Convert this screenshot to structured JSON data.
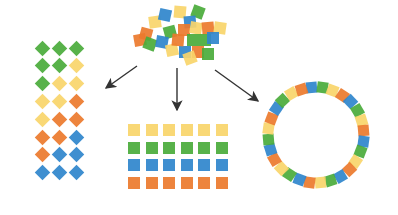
{
  "colors": {
    "green": "#4aab3b",
    "yellow": "#f8d56a",
    "orange": "#ec7a2c",
    "blue": "#2f86cc",
    "arrow": "#333333"
  },
  "pile": [
    {
      "x": 146,
      "y": 34,
      "s": 12,
      "r": 15,
      "c": "orange"
    },
    {
      "x": 140,
      "y": 40,
      "s": 12,
      "r": -10,
      "c": "orange"
    },
    {
      "x": 150,
      "y": 44,
      "s": 12,
      "r": 20,
      "c": "green"
    },
    {
      "x": 155,
      "y": 22,
      "s": 12,
      "r": -8,
      "c": "yellow"
    },
    {
      "x": 165,
      "y": 15,
      "s": 12,
      "r": 12,
      "c": "blue"
    },
    {
      "x": 170,
      "y": 32,
      "s": 12,
      "r": -15,
      "c": "green"
    },
    {
      "x": 162,
      "y": 42,
      "s": 12,
      "r": 10,
      "c": "blue"
    },
    {
      "x": 172,
      "y": 50,
      "s": 12,
      "r": -12,
      "c": "yellow"
    },
    {
      "x": 180,
      "y": 12,
      "s": 12,
      "r": 5,
      "c": "yellow"
    },
    {
      "x": 198,
      "y": 12,
      "s": 12,
      "r": 20,
      "c": "green"
    },
    {
      "x": 190,
      "y": 22,
      "s": 12,
      "r": -5,
      "c": "blue"
    },
    {
      "x": 184,
      "y": 30,
      "s": 12,
      "r": 0,
      "c": "orange"
    },
    {
      "x": 196,
      "y": 28,
      "s": 12,
      "r": 10,
      "c": "yellow"
    },
    {
      "x": 208,
      "y": 28,
      "s": 12,
      "r": -5,
      "c": "orange"
    },
    {
      "x": 220,
      "y": 28,
      "s": 12,
      "r": 8,
      "c": "yellow"
    },
    {
      "x": 193,
      "y": 40,
      "s": 12,
      "r": 0,
      "c": "green"
    },
    {
      "x": 205,
      "y": 40,
      "s": 12,
      "r": 0,
      "c": "green"
    },
    {
      "x": 213,
      "y": 38,
      "s": 12,
      "r": 0,
      "c": "blue"
    },
    {
      "x": 185,
      "y": 52,
      "s": 12,
      "r": 0,
      "c": "blue"
    },
    {
      "x": 198,
      "y": 52,
      "s": 12,
      "r": 0,
      "c": "orange"
    },
    {
      "x": 208,
      "y": 54,
      "s": 12,
      "r": 0,
      "c": "green"
    },
    {
      "x": 190,
      "y": 58,
      "s": 12,
      "r": -20,
      "c": "yellow"
    },
    {
      "x": 178,
      "y": 40,
      "s": 12,
      "r": 5,
      "c": "orange"
    }
  ],
  "diamond_grid": {
    "x0": 42,
    "y0": 48,
    "dx": 17,
    "dy": 17.8,
    "size": 11,
    "rows": [
      [
        "green",
        "green",
        "green"
      ],
      [
        "green",
        "green",
        "yellow"
      ],
      [
        "green",
        "yellow",
        "yellow"
      ],
      [
        "yellow",
        "yellow",
        "orange"
      ],
      [
        "yellow",
        "orange",
        "orange"
      ],
      [
        "orange",
        "orange",
        "blue"
      ],
      [
        "orange",
        "blue",
        "blue"
      ],
      [
        "blue",
        "blue",
        "blue"
      ]
    ]
  },
  "square_grid": {
    "x0": 128,
    "y0": 124,
    "dx": 17.5,
    "dy": 17.5,
    "size": 12,
    "cols": 6,
    "row_colors": [
      "yellow",
      "green",
      "blue",
      "orange"
    ]
  },
  "ring": {
    "cx": 316,
    "cy": 135,
    "radius": 48,
    "size": 11,
    "count": 28,
    "start_angle": -95,
    "pattern": [
      "blue",
      "green",
      "yellow",
      "orange"
    ]
  },
  "arrows": [
    {
      "x1": 137,
      "y1": 66,
      "x2": 106,
      "y2": 88
    },
    {
      "x1": 177,
      "y1": 68,
      "x2": 177,
      "y2": 110
    },
    {
      "x1": 215,
      "y1": 70,
      "x2": 258,
      "y2": 101
    }
  ]
}
